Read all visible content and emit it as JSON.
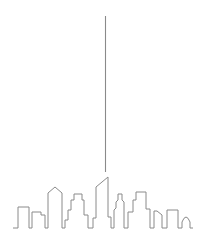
{
  "illustration": {
    "subject": "city-skyline-line-art",
    "stroke_color": "#8a8a8a",
    "background": "#ffffff",
    "beam": {
      "x": 105,
      "y1": 16,
      "y2": 172
    }
  }
}
